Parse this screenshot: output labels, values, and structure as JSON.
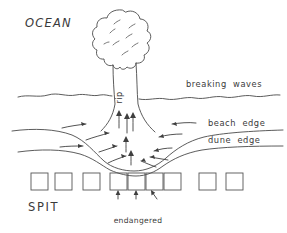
{
  "diagram": {
    "labels": {
      "ocean": "OCEAN",
      "spit": "SPIT",
      "rip": "rip",
      "breaking_waves": "breaking  waves",
      "beach_edge": "beach  edge",
      "dune_edge": "dune  edge",
      "endangered_line1": "endangered",
      "endangered_line2": "homes"
    },
    "colors": {
      "ink": "#4a4a4a",
      "ink_soft": "#5d5d5d",
      "background": "#ffffff",
      "text": "#3a3a3a"
    },
    "features": [
      {
        "name": "rip-head",
        "kind": "blob",
        "note": "lobed plume of sediment-laden water offshore"
      },
      {
        "name": "rip-neck",
        "kind": "channel",
        "note": "narrow seaward flow labelled rip"
      },
      {
        "name": "breaking-wave-line",
        "kind": "wavy-line",
        "note": "interrupted where the rip cuts through"
      },
      {
        "name": "beach-edge-line",
        "kind": "curve",
        "note": "embayed landward in the centre"
      },
      {
        "name": "dune-edge-line",
        "kind": "curve",
        "note": "eroded scallop in the centre"
      },
      {
        "name": "feeder-currents",
        "kind": "arrows",
        "note": "longshore feeder flow converging on the rip"
      }
    ],
    "houses": {
      "count": 9,
      "endangered_count": 3,
      "x_positions": [
        31,
        55,
        83,
        110,
        128,
        146,
        164,
        199,
        226
      ],
      "y": 173,
      "size": 17
    },
    "endangered_arrows": {
      "count": 3,
      "x_positions": [
        118,
        136,
        155
      ]
    }
  }
}
